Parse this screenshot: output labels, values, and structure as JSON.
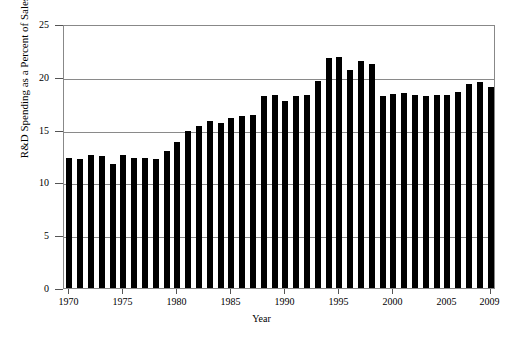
{
  "chart_data": {
    "type": "bar",
    "title": "",
    "xlabel": "Year",
    "ylabel": "R&D Spending as a Percent of Sales",
    "categories": [
      1970,
      1971,
      1972,
      1973,
      1974,
      1975,
      1976,
      1977,
      1978,
      1979,
      1980,
      1981,
      1982,
      1983,
      1984,
      1985,
      1986,
      1987,
      1988,
      1989,
      1990,
      1991,
      1992,
      1993,
      1994,
      1995,
      1996,
      1997,
      1998,
      1999,
      2000,
      2001,
      2002,
      2003,
      2004,
      2005,
      2006,
      2007,
      2008,
      2009
    ],
    "values": [
      12.3,
      12.2,
      12.6,
      12.5,
      11.7,
      12.6,
      12.3,
      12.3,
      12.2,
      13.0,
      13.8,
      14.9,
      15.3,
      15.8,
      15.6,
      16.1,
      16.3,
      16.4,
      18.2,
      18.3,
      17.7,
      18.2,
      18.3,
      19.6,
      21.8,
      21.9,
      20.6,
      21.5,
      21.2,
      18.2,
      18.4,
      18.5,
      18.3,
      18.2,
      18.3,
      18.3,
      18.6,
      19.3,
      19.5,
      19.0
    ],
    "ylim": [
      0,
      25
    ],
    "yticks": [
      0,
      5,
      10,
      15,
      20,
      25
    ],
    "xticks": [
      1970,
      1975,
      1980,
      1985,
      1990,
      1995,
      2000,
      2009
    ],
    "grid": true,
    "legend": null,
    "bar_color": "#000000",
    "grid_color": "#8a8a8a",
    "frame_color": "#888888"
  },
  "axes": {
    "y_title": "R&D Spending as a Percent of Sales",
    "x_title": "Year",
    "y_tick_labels": [
      "0",
      "5",
      "10",
      "15",
      "20",
      "25"
    ],
    "x_tick_labels": [
      "1970",
      "1975",
      "1980",
      "1985",
      "1990",
      "1995",
      "2000",
      "2005",
      "2009"
    ]
  }
}
